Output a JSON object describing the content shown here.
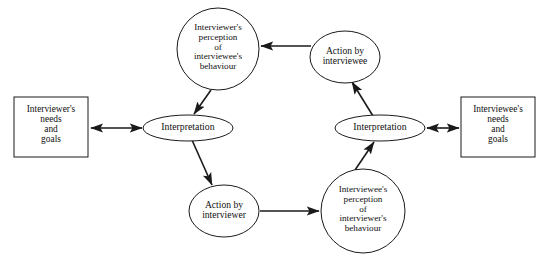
{
  "diagram": {
    "type": "cycle-diagram",
    "title": "",
    "colors": {
      "stroke": "#1a1a1a",
      "fill": "#ffffff",
      "text": "#111111",
      "background": "#ffffff"
    },
    "nodes": [
      {
        "id": "interviewer-perception",
        "shape": "circle",
        "lines": [
          "Interviewer's",
          "perception",
          "of",
          "interviewee's",
          "behaviour"
        ],
        "cx": 218,
        "cy": 49,
        "rx": 41,
        "ry": 41
      },
      {
        "id": "action-by-interviewee",
        "shape": "ellipse",
        "lines": [
          "Action by",
          "interviewee"
        ],
        "cx": 345,
        "cy": 57,
        "rx": 35,
        "ry": 26
      },
      {
        "id": "interpretation-right",
        "shape": "ellipse",
        "lines": [
          "Interpretation"
        ],
        "cx": 380,
        "cy": 128,
        "rx": 45,
        "ry": 13
      },
      {
        "id": "interviewee-perception",
        "shape": "circle",
        "lines": [
          "Interviewee's",
          "perception",
          "of",
          "interviewer's",
          "behaviour"
        ],
        "cx": 363,
        "cy": 211,
        "rx": 42,
        "ry": 42
      },
      {
        "id": "action-by-interviewer",
        "shape": "ellipse",
        "lines": [
          "Action by",
          "interviewer"
        ],
        "cx": 224,
        "cy": 211,
        "rx": 35,
        "ry": 26
      },
      {
        "id": "interpretation-left",
        "shape": "ellipse",
        "lines": [
          "Interpretation"
        ],
        "cx": 188,
        "cy": 128,
        "rx": 45,
        "ry": 13
      },
      {
        "id": "interviewer-needs",
        "shape": "rect",
        "lines": [
          "Interviewer's",
          "needs",
          "and",
          "goals"
        ],
        "x": 14,
        "y": 97,
        "width": 74,
        "height": 60
      },
      {
        "id": "interviewee-needs",
        "shape": "rect",
        "lines": [
          "Interviewee's",
          "needs",
          "and",
          "goals"
        ],
        "x": 461,
        "y": 97,
        "width": 74,
        "height": 60
      }
    ],
    "edges": [
      {
        "id": "edge-interviewee-action-to-interviewer-perception",
        "from": "action-by-interviewee",
        "to": "interviewer-perception",
        "arrows": "end",
        "x1": 311,
        "y1": 46,
        "x2": 261,
        "y2": 46
      },
      {
        "id": "edge-interviewer-perception-to-interpretation-left",
        "from": "interviewer-perception",
        "to": "interpretation-left",
        "arrows": "end",
        "x1": 211,
        "y1": 90,
        "x2": 194,
        "y2": 114
      },
      {
        "id": "edge-interpretation-left-to-action-by-interviewer",
        "from": "interpretation-left",
        "to": "action-by-interviewer",
        "arrows": "end",
        "x1": 192,
        "y1": 140,
        "x2": 212,
        "y2": 185
      },
      {
        "id": "edge-action-by-interviewer-to-interviewee-perception",
        "from": "action-by-interviewer",
        "to": "interviewee-perception",
        "arrows": "end",
        "x1": 260,
        "y1": 211,
        "x2": 319,
        "y2": 211
      },
      {
        "id": "edge-interviewee-perception-to-interpretation-right",
        "from": "interviewee-perception",
        "to": "interpretation-right",
        "arrows": "end",
        "x1": 355,
        "y1": 170,
        "x2": 374,
        "y2": 142
      },
      {
        "id": "edge-interpretation-right-to-action-by-interviewee",
        "from": "interpretation-right",
        "to": "action-by-interviewee",
        "arrows": "end",
        "x1": 373,
        "y1": 116,
        "x2": 352,
        "y2": 82
      },
      {
        "id": "edge-interviewer-needs-to-interpretation-left",
        "from": "interviewer-needs",
        "to": "interpretation-left",
        "arrows": "both",
        "x1": 89,
        "y1": 128,
        "x2": 144,
        "y2": 128
      },
      {
        "id": "edge-interpretation-right-to-interviewee-needs",
        "from": "interpretation-right",
        "to": "interviewee-needs",
        "arrows": "both",
        "x1": 425,
        "y1": 128,
        "x2": 460,
        "y2": 128
      }
    ]
  }
}
